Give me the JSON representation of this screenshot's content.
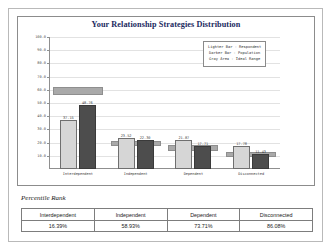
{
  "chart": {
    "title": "Your Relationship Strategies Distribution",
    "legend": [
      "Lighter Bar - Respondent",
      "Darker Bar  - Population",
      " Gray Area  - Ideal Range"
    ]
  },
  "percentile": {
    "heading": "Percentile Rank"
  },
  "chart_data": {
    "type": "bar",
    "title": "Your Relationship Strategies Distribution",
    "xlabel": "",
    "ylabel": "",
    "ylim": [
      0,
      100
    ],
    "yticks": [
      "100.0",
      "90.0",
      "80.0",
      "70.0",
      "60.0",
      "50.0",
      "40.0",
      "30.0",
      "20.0",
      "10.0"
    ],
    "grid": true,
    "legend_position": "top-right",
    "categories": [
      "Interdependent",
      "Independent",
      "Dependent",
      "Disconnected"
    ],
    "series": [
      {
        "name": "Respondent",
        "values": [
          37.15,
          23.52,
          21.87,
          17.78
        ]
      },
      {
        "name": "Population",
        "values": [
          48.76,
          22.3,
          17.71,
          11.43
        ]
      }
    ],
    "ideal_range": [
      {
        "category": "Interdependent",
        "low": 56.0,
        "high": 62.0
      },
      {
        "category": "Independent",
        "low": 17.5,
        "high": 21.5
      },
      {
        "category": "Dependent",
        "low": 14.0,
        "high": 18.0
      },
      {
        "category": "Disconnected",
        "low": 9.0,
        "high": 13.0
      }
    ],
    "bar_labels": {
      "respondent": [
        "37.15",
        "23.52",
        "21.87",
        "17.78"
      ],
      "population": [
        "48.76",
        "22.30",
        "17.71",
        "11.43"
      ]
    }
  },
  "table": {
    "headers": [
      "Interdependent",
      "Independent",
      "Dependent",
      "Disconnected"
    ],
    "values": [
      "16.39%",
      "58.93%",
      "73.71%",
      "86.08%"
    ]
  }
}
